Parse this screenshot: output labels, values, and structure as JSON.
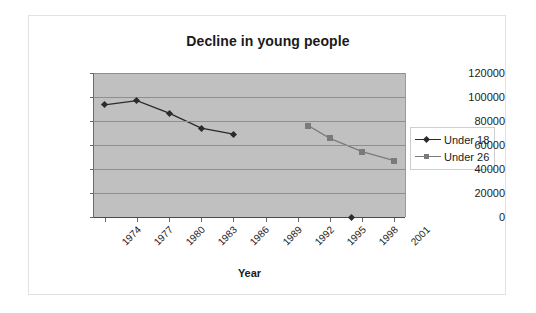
{
  "chart_data": {
    "type": "line",
    "title": "Decline in young people",
    "xlabel": "Year",
    "ylabel": "",
    "x": [
      1974,
      1977,
      1980,
      1983,
      1986,
      1989,
      1992,
      1995,
      1998,
      2001
    ],
    "tick_labels": [
      "1974",
      "1977",
      "1980",
      "1983",
      "1986",
      "1989",
      "1992",
      "1995",
      "1998",
      "2001"
    ],
    "xlim": [
      1973,
      2002
    ],
    "ylim": [
      0,
      120000
    ],
    "ytick_labels": [
      "0",
      "20000",
      "40000",
      "60000",
      "80000",
      "100000",
      "120000"
    ],
    "yticks": [
      0,
      20000,
      40000,
      60000,
      80000,
      100000,
      120000
    ],
    "grid": "horizontal",
    "legend_position": "right",
    "plot_background": "#c0c0c0",
    "series": [
      {
        "name": "Under 18",
        "color": "#2b2b2b",
        "marker": "diamond",
        "points": [
          {
            "x": 1974,
            "y": 93500
          },
          {
            "x": 1977,
            "y": 97000
          },
          {
            "x": 1980,
            "y": 86500
          },
          {
            "x": 1983,
            "y": 74000
          },
          {
            "x": 1986,
            "y": 69000
          }
        ],
        "isolated_points": [
          {
            "x": 1997,
            "y": 0
          }
        ]
      },
      {
        "name": "Under 26",
        "color": "#7a7a7a",
        "marker": "square",
        "points": [
          {
            "x": 1993,
            "y": 76000
          },
          {
            "x": 1995,
            "y": 65500
          },
          {
            "x": 1998,
            "y": 54500
          },
          {
            "x": 2001,
            "y": 47000
          }
        ],
        "isolated_points": []
      }
    ]
  }
}
